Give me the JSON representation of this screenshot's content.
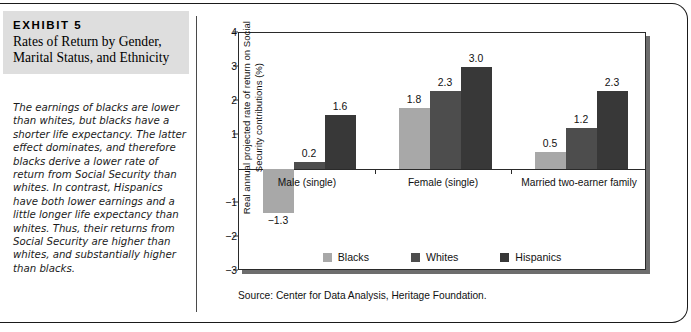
{
  "exhibit": {
    "kicker": "EXHIBIT 5",
    "title": "Rates of Return by Gender, Marital Status, and Ethnicity",
    "caption": "The earnings of blacks are lower than whites, but blacks have a shorter life expectancy. The latter effect dominates, and therefore blacks derive a lower rate of return from Social Security than whites. In contrast, Hispanics have both lower earnings and a little longer life expectancy than whites. Thus, their returns from Social Security are higher than whites, and substantially higher than blacks."
  },
  "source": "Source: Center for Data Analysis, Heritage Foundation.",
  "colors": {
    "blacks": "#a8a8a8",
    "whites": "#4d4d4d",
    "hispanics": "#383838",
    "axis": "#2a2a2a",
    "shadow": "#6d6d6d",
    "title_bg": "#dedede"
  },
  "chart_data": {
    "type": "bar",
    "title": "Rates of Return by Gender, Marital Status, and Ethnicity",
    "xlabel": "",
    "ylabel": "Real annual projected rate of return on Social Security contributions (%)",
    "categories": [
      "Male (single)",
      "Female (single)",
      "Married two-earner family"
    ],
    "series": [
      {
        "name": "Blacks",
        "color": "#a8a8a8",
        "values": [
          -1.3,
          1.8,
          0.5
        ],
        "labels": [
          "−1.3",
          "1.8",
          "0.5"
        ]
      },
      {
        "name": "Whites",
        "color": "#4d4d4d",
        "values": [
          0.2,
          2.3,
          1.2
        ],
        "labels": [
          "0.2",
          "2.3",
          "1.2"
        ]
      },
      {
        "name": "Hispanics",
        "color": "#383838",
        "values": [
          1.6,
          3.0,
          2.3
        ],
        "labels": [
          "1.6",
          "3.0",
          "2.3"
        ]
      }
    ],
    "ylim": [
      -3,
      4
    ],
    "yticks": [
      4,
      3,
      2,
      1,
      -1,
      -2,
      -3
    ],
    "ytick_labels": [
      "4",
      "3",
      "2",
      "1",
      "−1",
      "−2",
      "−3"
    ],
    "grid": false,
    "legend_position": "bottom"
  }
}
